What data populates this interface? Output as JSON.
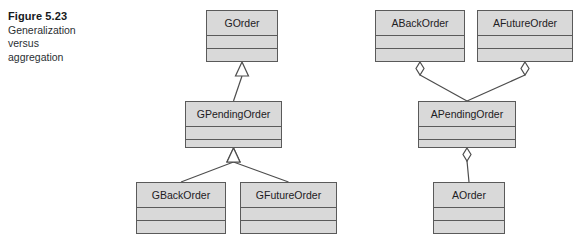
{
  "figure": {
    "caption_title": "Figure 5.23",
    "caption_lines": [
      "Generalization",
      "versus",
      "aggregation"
    ]
  },
  "colors": {
    "box_fill": "#d9d9d9",
    "box_border": "#5a5a5a",
    "line": "#4d4d4d",
    "marker_fill": "#ffffff",
    "text": "#1d2023",
    "background": "#ffffff"
  },
  "diagrams": [
    {
      "id": "generalization",
      "relation_type": "generalization",
      "classes": [
        {
          "id": "gorder",
          "name": "GOrder",
          "x": 206,
          "y": 10,
          "w": 72,
          "h": 52
        },
        {
          "id": "gpendingorder",
          "name": "GPendingOrder",
          "x": 185,
          "y": 101,
          "w": 97,
          "h": 47
        },
        {
          "id": "gbackorder",
          "name": "GBackOrder",
          "x": 136,
          "y": 182,
          "w": 90,
          "h": 52
        },
        {
          "id": "gfutureorder",
          "name": "GFutureOrder",
          "x": 240,
          "y": 182,
          "w": 97,
          "h": 52
        }
      ],
      "links": [
        {
          "from": "gpendingorder",
          "to": "gorder",
          "marker": "hollow-triangle"
        },
        {
          "from": "gbackorder",
          "to": "gpendingorder",
          "marker": "hollow-triangle"
        },
        {
          "from": "gfutureorder",
          "to": "gpendingorder",
          "marker": "hollow-triangle"
        }
      ]
    },
    {
      "id": "aggregation",
      "relation_type": "aggregation",
      "classes": [
        {
          "id": "abackorder",
          "name": "ABackOrder",
          "x": 375,
          "y": 10,
          "w": 90,
          "h": 52
        },
        {
          "id": "afutureorder",
          "name": "AFutureOrder",
          "x": 477,
          "y": 10,
          "w": 96,
          "h": 52
        },
        {
          "id": "apendingorder",
          "name": "APendingOrder",
          "x": 418,
          "y": 101,
          "w": 98,
          "h": 47
        },
        {
          "id": "aorder",
          "name": "AOrder",
          "x": 433,
          "y": 182,
          "w": 72,
          "h": 52
        }
      ],
      "links": [
        {
          "from": "abackorder",
          "to": "apendingorder",
          "marker": "hollow-diamond"
        },
        {
          "from": "afutureorder",
          "to": "apendingorder",
          "marker": "hollow-diamond"
        },
        {
          "from": "apendingorder",
          "to": "aorder",
          "marker": "hollow-diamond"
        }
      ]
    }
  ]
}
